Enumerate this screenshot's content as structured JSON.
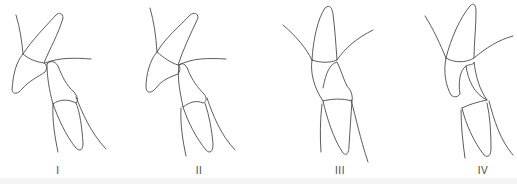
{
  "figure": {
    "panels": [
      {
        "id": "panel-1",
        "label": "I",
        "label_x": 58
      },
      {
        "id": "panel-2",
        "label": "II",
        "label_x": 199
      },
      {
        "id": "panel-3",
        "label": "III",
        "label_x": 340
      },
      {
        "id": "panel-4",
        "label": "IV",
        "label_x": 483
      }
    ],
    "colors": {
      "line": "#4a4a4a",
      "background": "#ffffff",
      "label": "#444444"
    }
  }
}
